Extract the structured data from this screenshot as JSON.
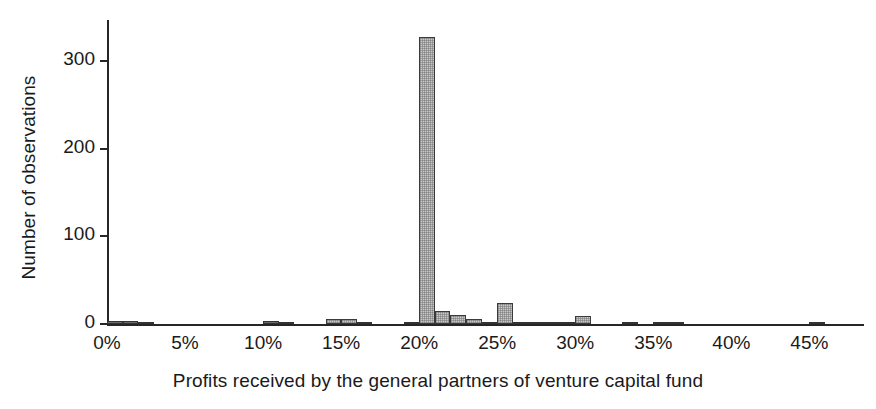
{
  "chart_data": {
    "type": "bar",
    "title": "",
    "subtitle": "",
    "xlabel": "Profits received by the general partners of venture capital fund",
    "ylabel": "Number of observations",
    "xlim": [
      0,
      48.5
    ],
    "ylim": [
      0,
      345
    ],
    "grid": false,
    "legend": null,
    "bin_width": 1,
    "xtick_labels": [
      "0%",
      "5%",
      "10%",
      "15%",
      "20%",
      "25%",
      "30%",
      "35%",
      "40%",
      "45%"
    ],
    "xtick_values": [
      0,
      5,
      10,
      15,
      20,
      25,
      30,
      35,
      40,
      45
    ],
    "ytick_labels": [
      "0",
      "100",
      "200",
      "300"
    ],
    "ytick_values": [
      0,
      100,
      200,
      300
    ],
    "x": [
      0,
      1,
      2,
      3,
      4,
      5,
      6,
      7,
      8,
      9,
      10,
      11,
      12,
      13,
      14,
      15,
      16,
      17,
      18,
      19,
      20,
      21,
      22,
      23,
      24,
      25,
      26,
      27,
      28,
      29,
      30,
      31,
      32,
      33,
      34,
      35,
      36,
      37,
      38,
      39,
      40,
      41,
      42,
      43,
      44,
      45,
      46,
      47
    ],
    "values": [
      3,
      3,
      2,
      0,
      0,
      0,
      0,
      0,
      0,
      0,
      4,
      1,
      0,
      0,
      6,
      6,
      1,
      0,
      0,
      1,
      328,
      15,
      10,
      6,
      2,
      24,
      1,
      1,
      2,
      2,
      9,
      0,
      0,
      1,
      0,
      1,
      1,
      0,
      0,
      0,
      0,
      0,
      0,
      0,
      0,
      1,
      0,
      0
    ],
    "categories": [
      "0%",
      "1%",
      "2%",
      "3%",
      "4%",
      "5%",
      "6%",
      "7%",
      "8%",
      "9%",
      "10%",
      "11%",
      "12%",
      "13%",
      "14%",
      "15%",
      "16%",
      "17%",
      "18%",
      "19%",
      "20%",
      "21%",
      "22%",
      "23%",
      "24%",
      "25%",
      "26%",
      "27%",
      "28%",
      "29%",
      "30%",
      "31%",
      "32%",
      "33%",
      "34%",
      "35%",
      "36%",
      "37%",
      "38%",
      "39%",
      "40%",
      "41%",
      "42%",
      "43%",
      "44%",
      "45%",
      "46%",
      "47%"
    ],
    "bar_fill_color": "#c9c9c9",
    "bar_edge_color": "#3a3a3a",
    "axis_color": "#262626",
    "background_color": "#ffffff",
    "peak": {
      "x": "20%",
      "value": 328
    }
  }
}
